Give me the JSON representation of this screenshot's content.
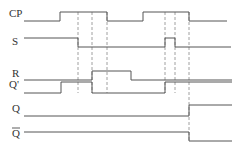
{
  "diagram": {
    "type": "timing-diagram",
    "signals": [
      {
        "label": "CP",
        "label_x": 9,
        "label_y": 17,
        "line_x": 24,
        "high_y": 12,
        "low_y": 21,
        "points": [
          [
            24,
            21
          ],
          [
            60,
            21
          ],
          [
            60,
            12
          ],
          [
            107,
            12
          ],
          [
            107,
            21
          ],
          [
            143,
            21
          ],
          [
            143,
            12
          ],
          [
            189,
            12
          ],
          [
            189,
            21
          ],
          [
            227,
            21
          ]
        ]
      },
      {
        "label": "S",
        "label_x": 12,
        "label_y": 45,
        "line_x": 24,
        "high_y": 38,
        "low_y": 47,
        "points": [
          [
            24,
            38
          ],
          [
            78,
            38
          ],
          [
            78,
            47
          ],
          [
            165,
            47
          ],
          [
            165,
            38
          ],
          [
            175,
            38
          ],
          [
            175,
            47
          ],
          [
            231,
            47
          ]
        ]
      },
      {
        "label": "R",
        "label_x": 12,
        "label_y": 77,
        "line_x": 24,
        "high_y": 71,
        "low_y": 80,
        "points": [
          [
            24,
            80
          ],
          [
            92,
            80
          ],
          [
            92,
            71
          ],
          [
            131,
            71
          ],
          [
            131,
            80
          ],
          [
            232,
            80
          ]
        ]
      },
      {
        "label": "Q'",
        "label_x": 9,
        "label_y": 88,
        "line_x": 24,
        "high_y": 82,
        "low_y": 93,
        "points": [
          [
            24,
            93
          ],
          [
            61,
            93
          ],
          [
            61,
            82
          ],
          [
            92,
            82
          ],
          [
            92,
            93
          ],
          [
            165,
            93
          ],
          [
            165,
            82
          ],
          [
            232,
            82
          ]
        ]
      },
      {
        "label": "Q",
        "label_x": 12,
        "label_y": 112,
        "line_x": 24,
        "high_y": 105,
        "low_y": 116,
        "points": [
          [
            24,
            116
          ],
          [
            189,
            116
          ],
          [
            189,
            105
          ],
          [
            232,
            105
          ]
        ]
      },
      {
        "label": "Q",
        "label_overbar": true,
        "label_x": 12,
        "label_y": 137,
        "line_x": 24,
        "high_y": 132,
        "low_y": 141,
        "points": [
          [
            24,
            132
          ],
          [
            189,
            132
          ],
          [
            189,
            141
          ],
          [
            232,
            141
          ]
        ]
      }
    ],
    "dashed_guides": [
      {
        "x": 78,
        "y1": 12,
        "y2": 93
      },
      {
        "x": 92,
        "y1": 12,
        "y2": 93
      },
      {
        "x": 107,
        "y1": 12,
        "y2": 93
      },
      {
        "x": 165,
        "y1": 12,
        "y2": 93
      },
      {
        "x": 175,
        "y1": 12,
        "y2": 93
      },
      {
        "x": 189,
        "y1": 12,
        "y2": 141
      }
    ],
    "colors": {
      "signal": "#555555",
      "guide": "#888888",
      "label": "#333333"
    }
  }
}
